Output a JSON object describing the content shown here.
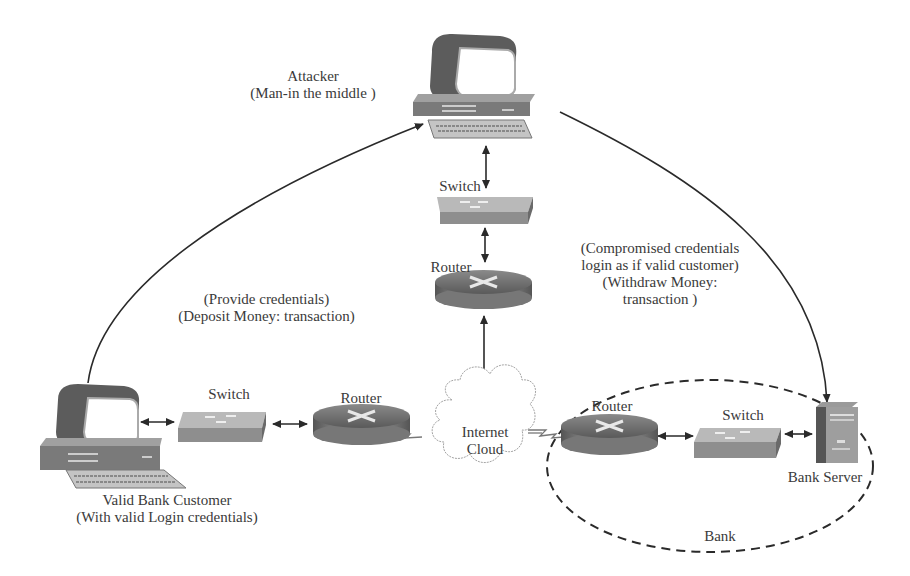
{
  "diagram": {
    "nodes": {
      "attacker": {
        "line1": "Attacker",
        "line2": "(Man-in the middle )",
        "icon": "desktop-computer-icon"
      },
      "top_switch": {
        "label": "Switch",
        "icon": "switch-icon"
      },
      "top_router": {
        "label": "Router",
        "icon": "router-icon"
      },
      "customer": {
        "line1": "Valid Bank Customer",
        "line2": "(With valid Login credentials)",
        "icon": "desktop-computer-icon"
      },
      "customer_switch": {
        "label": "Switch",
        "icon": "switch-icon"
      },
      "customer_router": {
        "label": "Router",
        "icon": "router-icon"
      },
      "internet": {
        "line1": "Internet",
        "line2": "Cloud",
        "icon": "cloud-icon"
      },
      "bank_router": {
        "label": "Router",
        "icon": "router-icon"
      },
      "bank_switch": {
        "label": "Switch",
        "icon": "switch-icon"
      },
      "bank_server": {
        "label": "Bank Server",
        "icon": "server-tower-icon"
      },
      "bank_zone": {
        "label": "Bank"
      }
    },
    "annotations": {
      "customer_to_attacker": {
        "line1": "(Provide credentials)",
        "line2": "(Deposit Money: transaction)"
      },
      "attacker_to_bank": {
        "line1": "(Compromised credentials",
        "line2": "login as if valid customer)",
        "line3": "(Withdraw Money:",
        "line4": "transaction )"
      }
    },
    "colors": {
      "line": "#2a2a2a",
      "device_dark": "#5a5a5a",
      "device_mid": "#9a9a9a",
      "device_light": "#c8c8c8",
      "cloud_stroke": "#9a9a9a"
    }
  }
}
